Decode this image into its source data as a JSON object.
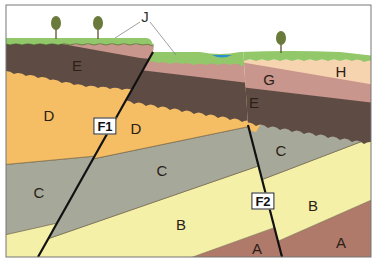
{
  "diagram": {
    "type": "geologic-cross-section",
    "colors": {
      "A": "#b07a6a",
      "B": "#f4f0a8",
      "C": "#a6a89a",
      "D": "#f6be64",
      "E": "#5e4c44",
      "G": "#c8968c",
      "H": "#f6d4b0",
      "J": "#92c86a",
      "water": "#2c8fd0",
      "fault": "#111111",
      "frame": "#777777"
    },
    "layers": [
      {
        "id": "A",
        "label": "A"
      },
      {
        "id": "B",
        "label": "B"
      },
      {
        "id": "C",
        "label": "C"
      },
      {
        "id": "D",
        "label": "D"
      },
      {
        "id": "E",
        "label": "E"
      },
      {
        "id": "G",
        "label": "G"
      },
      {
        "id": "H",
        "label": "H"
      },
      {
        "id": "J",
        "label": "J"
      }
    ],
    "faults": [
      {
        "id": "F1",
        "label": "F1"
      },
      {
        "id": "F2",
        "label": "F2"
      }
    ],
    "labels": {
      "E_left": "E",
      "E_mid": "E",
      "D_left": "D",
      "D_mid": "D",
      "C_left": "C",
      "C_mid": "C",
      "C_right": "C",
      "B_mid": "B",
      "B_right": "B",
      "A_mid": "A",
      "A_right": "A",
      "G": "G",
      "H": "H",
      "J": "J",
      "F1": "F1",
      "F2": "F2"
    },
    "features": [
      "tree",
      "tree",
      "tree",
      "water-pond"
    ]
  }
}
